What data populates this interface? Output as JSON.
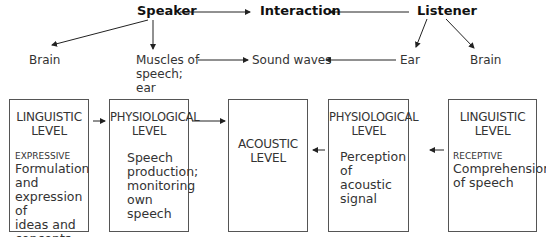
{
  "top": {
    "speaker": "Speaker",
    "interaction": "Interaction",
    "listener": "Listener"
  },
  "middle": {
    "brain_left": "Brain",
    "muscles_line1": "Muscles of",
    "muscles_line2": "speech;",
    "muscles_line3": "ear",
    "sound_waves": "Sound waves",
    "ear": "Ear",
    "brain_right": "Brain"
  },
  "boxes": [
    {
      "title1": "LINGUISTIC",
      "title2": "LEVEL",
      "qualifier": "EXPRESSIVE",
      "body": [
        "Formulation",
        "and",
        "expression of",
        "ideas and",
        "concepts"
      ]
    },
    {
      "title1": "PHYSIOLOGICAL",
      "title2": "LEVEL",
      "body": [
        "Speech",
        "production;",
        "monitoring",
        "own speech"
      ]
    },
    {
      "title1": "ACOUSTIC",
      "title2": "LEVEL"
    },
    {
      "title1": "PHYSIOLOGICAL",
      "title2": "LEVEL",
      "body": [
        "Perception of",
        "acoustic signal"
      ]
    },
    {
      "title1": "LINGUISTIC",
      "title2": "LEVEL",
      "qualifier": "RECEPTIVE",
      "body": [
        "Comprehension",
        "of speech"
      ]
    }
  ]
}
